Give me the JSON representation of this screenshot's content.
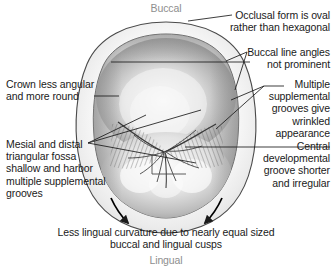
{
  "figure": {
    "orientation": {
      "top_label": "Buccal",
      "bottom_label": "Lingual"
    },
    "caption": "Less lingual curvature due to nearly equal sized\nbuccal and lingual cusps",
    "annotations": [
      {
        "id": "occlusal-form",
        "text": "Occlusal form is oval\nrather than hexagonal",
        "align": "right"
      },
      {
        "id": "buccal-line-angles",
        "text": "Buccal line angles\nnot prominent",
        "align": "right"
      },
      {
        "id": "multiple-supplemental-grooves",
        "text": "Multiple\nsupplemental\ngrooves give\nwrinkled\nappearance",
        "align": "right"
      },
      {
        "id": "central-developmental-groove",
        "text": "Central\ndevelopmental\ngroove shorter\nand irregular",
        "align": "right"
      },
      {
        "id": "crown-less-angular",
        "text": "Crown less angular\nand more round",
        "align": "left"
      },
      {
        "id": "mesial-distal-fossa",
        "text": "Mesial and distal\ntriangular fossa\nshallow and harbor\nmultiple supplemental\ngrooves",
        "align": "left"
      }
    ]
  },
  "colors": {
    "background": "#ffffff",
    "text": "#1a1a1a",
    "orientation_text": "#8e8e8e",
    "leader_line": "#1a1a1a",
    "outline": "#3c3c3c",
    "tooth_light": "#f2f2f2",
    "tooth_mid": "#c9c9c9",
    "tooth_dark": "#8a8a8a",
    "arrow": "#000000"
  }
}
